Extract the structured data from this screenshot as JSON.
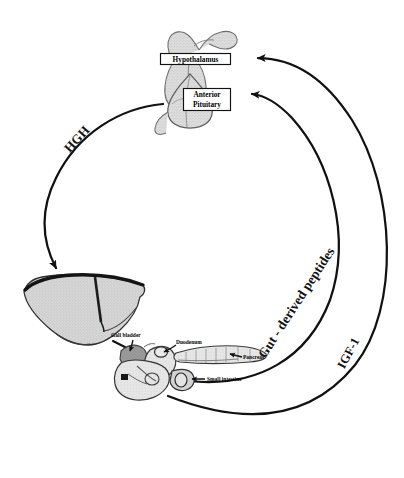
{
  "figure": {
    "type": "endocrine-feedback-loop-diagram",
    "background_color": "#ffffff",
    "line_color": "#111111"
  },
  "glands": {
    "hypothalamus": {
      "label": "Hypothalamus",
      "fill": "#d9d9d9"
    },
    "anterior_pituitary": {
      "label_line1": "Anterior",
      "label_line2": "Pituitary",
      "fill": "#d4d4d4"
    }
  },
  "organs": {
    "liver": {
      "name": "liver",
      "fill": "#d2d2d2"
    },
    "gall_bladder": {
      "label": "Gall bladder",
      "fill": "#9a9a9a"
    },
    "duodenum": {
      "label": "Duodenum",
      "fill": "#e2e2e2"
    },
    "pancreas": {
      "label": "Pancreas",
      "fill": "#dedede"
    },
    "small_intestine": {
      "label": "Small intestine",
      "fill": "#c6c6c6"
    }
  },
  "pathways": {
    "hgh": {
      "label": "HGH",
      "from": "anterior-pituitary",
      "to": "liver",
      "rotation_deg": -48
    },
    "igf1": {
      "label": "IGF-1",
      "from": "liver",
      "to": "hypothalamus",
      "rotation_deg": -62
    },
    "gut_peptides": {
      "label": "Gut - derived peptides",
      "from": "small-intestine",
      "to": "anterior-pituitary",
      "rotation_deg": -57
    }
  }
}
